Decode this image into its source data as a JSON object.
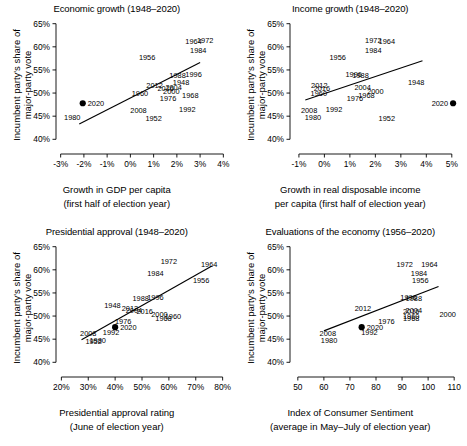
{
  "figure": {
    "ylabel": "Incumbent party's share of major-party vote",
    "ylabel_line1": "Incumbent party's share of",
    "ylabel_line2": "major-party vote",
    "y_ticks": [
      "40%",
      "45%",
      "50%",
      "55%",
      "60%",
      "65%"
    ],
    "y_tick_values": [
      40,
      45,
      50,
      55,
      60,
      65
    ],
    "highlight_year": "2020",
    "point_color": "#000000",
    "line_color": "#000000",
    "axis_color": "#000000",
    "background": "#ffffff"
  },
  "chart_data": [
    {
      "type": "scatter",
      "panel": "top-left",
      "title": "Economic growth (1948–2020)",
      "xlabel": "Growth in GDP per capita",
      "xlabel2": "(first half of election year)",
      "ylabel": "Incumbent party's share of major-party vote",
      "xlim": [
        -3.2,
        4.2
      ],
      "ylim": [
        39.2,
        65.8
      ],
      "x_ticks": [
        "-3%",
        "-2%",
        "-1%",
        "0%",
        "1%",
        "2%",
        "3%",
        "4%"
      ],
      "x_tick_values": [
        -3,
        -2,
        -1,
        0,
        1,
        2,
        3,
        4
      ],
      "y_ticks": [
        "40%",
        "45%",
        "50%",
        "55%",
        "60%",
        "65%"
      ],
      "y_tick_values": [
        40,
        45,
        50,
        55,
        60,
        65
      ],
      "grid": false,
      "legend": "none",
      "fit_line": {
        "x": [
          -2.2,
          3.0
        ],
        "y": [
          43.3,
          56.6
        ]
      },
      "labels": [
        "1948",
        "1952",
        "1956",
        "1960",
        "1964",
        "1968",
        "1972",
        "1976",
        "1980",
        "1984",
        "1988",
        "1992",
        "1996",
        "2000",
        "2004",
        "2008",
        "2012",
        "2016",
        "2020"
      ],
      "points": [
        {
          "year": "1948",
          "x": 2.18,
          "y": 52.4,
          "marker": false
        },
        {
          "year": "1952",
          "x": 1.0,
          "y": 44.6,
          "marker": false
        },
        {
          "year": "1956",
          "x": 0.72,
          "y": 57.8,
          "marker": false
        },
        {
          "year": "1960",
          "x": 0.41,
          "y": 49.9,
          "marker": false
        },
        {
          "year": "1964",
          "x": 2.72,
          "y": 61.3,
          "marker": false
        },
        {
          "year": "1968",
          "x": 2.58,
          "y": 49.6,
          "marker": false
        },
        {
          "year": "1972",
          "x": 3.22,
          "y": 61.4,
          "marker": false
        },
        {
          "year": "1976",
          "x": 1.62,
          "y": 48.9,
          "marker": false
        },
        {
          "year": "1980",
          "x": -2.5,
          "y": 44.7,
          "marker": false
        },
        {
          "year": "1984",
          "x": 2.92,
          "y": 59.2,
          "marker": false
        },
        {
          "year": "1988",
          "x": 2.03,
          "y": 53.9,
          "marker": false
        },
        {
          "year": "1992",
          "x": 2.45,
          "y": 46.5,
          "marker": false
        },
        {
          "year": "1996",
          "x": 2.72,
          "y": 54.0,
          "marker": false
        },
        {
          "year": "2000",
          "x": 1.76,
          "y": 50.3,
          "marker": false
        },
        {
          "year": "2004",
          "x": 1.86,
          "y": 51.2,
          "marker": false
        },
        {
          "year": "2008",
          "x": 0.35,
          "y": 46.3,
          "marker": false
        },
        {
          "year": "2012",
          "x": 1.04,
          "y": 51.8,
          "marker": false
        },
        {
          "year": "2016",
          "x": 1.52,
          "y": 51.1,
          "marker": false
        },
        {
          "year": "2020",
          "x": -2.05,
          "y": 47.8,
          "marker": true
        }
      ]
    },
    {
      "type": "scatter",
      "panel": "top-right",
      "title": "Income growth (1948–2020)",
      "xlabel": "Growth in real disposable income",
      "xlabel2": "per capita (first half of election year)",
      "ylabel": "Incumbent party's share of major-party vote",
      "xlim": [
        -1.35,
        5.4
      ],
      "ylim": [
        39.2,
        65.8
      ],
      "x_ticks": [
        "-1%",
        "0%",
        "1%",
        "2%",
        "3%",
        "4%",
        "5%"
      ],
      "x_tick_values": [
        -1,
        0,
        1,
        2,
        3,
        4,
        5
      ],
      "y_ticks": [
        "40%",
        "45%",
        "50%",
        "55%",
        "60%",
        "65%"
      ],
      "y_tick_values": [
        40,
        45,
        50,
        55,
        60,
        65
      ],
      "grid": false,
      "legend": "none",
      "fit_line": {
        "x": [
          -0.75,
          3.85
        ],
        "y": [
          48.5,
          57.0
        ]
      },
      "labels": [
        "1948",
        "1952",
        "1956",
        "1960",
        "1964",
        "1968",
        "1972",
        "1976",
        "1980",
        "1984",
        "1988",
        "1992",
        "1996",
        "2000",
        "2004",
        "2008",
        "2012",
        "2016",
        "2020"
      ],
      "points": [
        {
          "year": "1948",
          "x": 3.6,
          "y": 52.4,
          "marker": false
        },
        {
          "year": "1952",
          "x": 2.45,
          "y": 44.6,
          "marker": false
        },
        {
          "year": "1956",
          "x": 0.52,
          "y": 57.8,
          "marker": false
        },
        {
          "year": "1960",
          "x": -0.22,
          "y": 49.9,
          "marker": false
        },
        {
          "year": "1964",
          "x": 2.45,
          "y": 61.3,
          "marker": false
        },
        {
          "year": "1968",
          "x": 1.65,
          "y": 49.6,
          "marker": false
        },
        {
          "year": "1972",
          "x": 1.92,
          "y": 61.4,
          "marker": false
        },
        {
          "year": "1976",
          "x": 1.2,
          "y": 48.9,
          "marker": false
        },
        {
          "year": "1980",
          "x": -0.45,
          "y": 44.7,
          "marker": false
        },
        {
          "year": "1984",
          "x": 1.92,
          "y": 59.2,
          "marker": false
        },
        {
          "year": "1988",
          "x": 1.42,
          "y": 53.9,
          "marker": false
        },
        {
          "year": "1992",
          "x": 0.38,
          "y": 46.5,
          "marker": false
        },
        {
          "year": "1996",
          "x": 1.15,
          "y": 54.0,
          "marker": false
        },
        {
          "year": "2000",
          "x": 2.0,
          "y": 50.3,
          "marker": false
        },
        {
          "year": "2004",
          "x": 1.5,
          "y": 51.2,
          "marker": false
        },
        {
          "year": "2008",
          "x": -0.6,
          "y": 46.3,
          "marker": false
        },
        {
          "year": "2012",
          "x": -0.2,
          "y": 51.8,
          "marker": false
        },
        {
          "year": "2016",
          "x": -0.1,
          "y": 51.1,
          "marker": false
        },
        {
          "year": "2020",
          "x": 5.05,
          "y": 47.8,
          "marker": true
        }
      ]
    },
    {
      "type": "scatter",
      "panel": "bottom-left",
      "title": "Presidential approval (1948–2020)",
      "xlabel": "Presidential approval rating",
      "xlabel2": "(June of election year)",
      "ylabel": "Incumbent party's share of major-party vote",
      "xlim": [
        18,
        82
      ],
      "ylim": [
        39.2,
        65.8
      ],
      "x_ticks": [
        "20%",
        "30%",
        "40%",
        "50%",
        "60%",
        "70%",
        "80%"
      ],
      "x_tick_values": [
        20,
        30,
        40,
        50,
        60,
        70,
        80
      ],
      "y_ticks": [
        "40%",
        "45%",
        "50%",
        "55%",
        "60%",
        "65%"
      ],
      "y_tick_values": [
        40,
        45,
        50,
        55,
        60,
        65
      ],
      "grid": false,
      "legend": "none",
      "fit_line": {
        "x": [
          27.5,
          76.0
        ],
        "y": [
          44.9,
          60.8
        ]
      },
      "labels": [
        "1948",
        "1952",
        "1956",
        "1960",
        "1964",
        "1968",
        "1972",
        "1976",
        "1980",
        "1984",
        "1988",
        "1992",
        "1996",
        "2000",
        "2004",
        "2008",
        "2012",
        "2016",
        "2020"
      ],
      "points": [
        {
          "year": "1948",
          "x": 39.0,
          "y": 52.4,
          "marker": false
        },
        {
          "year": "1952",
          "x": 32.0,
          "y": 44.6,
          "marker": false
        },
        {
          "year": "1956",
          "x": 72.0,
          "y": 57.8,
          "marker": false
        },
        {
          "year": "1960",
          "x": 61.5,
          "y": 49.9,
          "marker": false
        },
        {
          "year": "1964",
          "x": 75.0,
          "y": 61.3,
          "marker": false
        },
        {
          "year": "1968",
          "x": 58.0,
          "y": 49.6,
          "marker": false
        },
        {
          "year": "1972",
          "x": 60.0,
          "y": 61.8,
          "marker": false
        },
        {
          "year": "1976",
          "x": 43.0,
          "y": 48.9,
          "marker": false
        },
        {
          "year": "1980",
          "x": 33.5,
          "y": 44.7,
          "marker": false
        },
        {
          "year": "1984",
          "x": 55.0,
          "y": 59.2,
          "marker": false
        },
        {
          "year": "1988",
          "x": 49.5,
          "y": 53.9,
          "marker": false
        },
        {
          "year": "1992",
          "x": 38.5,
          "y": 46.5,
          "marker": false
        },
        {
          "year": "1996",
          "x": 55.0,
          "y": 54.0,
          "marker": false
        },
        {
          "year": "2000",
          "x": 56.5,
          "y": 50.3,
          "marker": false
        },
        {
          "year": "2004",
          "x": 47.0,
          "y": 51.2,
          "marker": false
        },
        {
          "year": "2008",
          "x": 30.0,
          "y": 46.3,
          "marker": false
        },
        {
          "year": "2012",
          "x": 45.5,
          "y": 51.8,
          "marker": false
        },
        {
          "year": "2016",
          "x": 51.0,
          "y": 51.1,
          "marker": false
        },
        {
          "year": "2020",
          "x": 40.0,
          "y": 47.6,
          "marker": true
        }
      ]
    },
    {
      "type": "scatter",
      "panel": "bottom-right",
      "title": "Evaluations of the economy (1956–2020)",
      "xlabel": "Index of Consumer Sentiment",
      "xlabel2": "(average in May–July of election year)",
      "ylabel": "Incumbent party's share of major-party vote",
      "xlim": [
        47,
        113
      ],
      "ylim": [
        39.2,
        65.8
      ],
      "x_ticks": [
        "50",
        "60",
        "70",
        "80",
        "90",
        "100",
        "110"
      ],
      "x_tick_values": [
        50,
        60,
        70,
        80,
        90,
        100,
        110
      ],
      "y_ticks": [
        "40%",
        "45%",
        "50%",
        "55%",
        "60%",
        "65%"
      ],
      "y_tick_values": [
        40,
        45,
        50,
        55,
        60,
        65
      ],
      "grid": false,
      "legend": "none",
      "fit_line": {
        "x": [
          60.0,
          104.0
        ],
        "y": [
          46.8,
          56.4
        ]
      },
      "labels": [
        "1956",
        "1960",
        "1964",
        "1968",
        "1972",
        "1976",
        "1980",
        "1984",
        "1988",
        "1992",
        "1996",
        "2000",
        "2004",
        "2008",
        "2012",
        "2016",
        "2020"
      ],
      "points": [
        {
          "year": "1956",
          "x": 97.0,
          "y": 57.8,
          "marker": false
        },
        {
          "year": "1960",
          "x": 93.5,
          "y": 49.9,
          "marker": false
        },
        {
          "year": "1964",
          "x": 100.5,
          "y": 61.3,
          "marker": false
        },
        {
          "year": "1968",
          "x": 93.5,
          "y": 49.6,
          "marker": false
        },
        {
          "year": "1972",
          "x": 91.0,
          "y": 61.3,
          "marker": false
        },
        {
          "year": "1976",
          "x": 84.0,
          "y": 48.9,
          "marker": false
        },
        {
          "year": "1980",
          "x": 62.0,
          "y": 44.7,
          "marker": false
        },
        {
          "year": "1984",
          "x": 96.5,
          "y": 59.2,
          "marker": false
        },
        {
          "year": "1988",
          "x": 94.5,
          "y": 53.9,
          "marker": false
        },
        {
          "year": "1992",
          "x": 77.5,
          "y": 46.5,
          "marker": false
        },
        {
          "year": "1996",
          "x": 92.5,
          "y": 54.0,
          "marker": false
        },
        {
          "year": "2000",
          "x": 107.5,
          "y": 50.3,
          "marker": false
        },
        {
          "year": "2004",
          "x": 94.5,
          "y": 51.2,
          "marker": false
        },
        {
          "year": "2008",
          "x": 61.5,
          "y": 46.3,
          "marker": false
        },
        {
          "year": "2012",
          "x": 75.0,
          "y": 51.8,
          "marker": false
        },
        {
          "year": "2016",
          "x": 93.5,
          "y": 51.1,
          "marker": false
        },
        {
          "year": "2020",
          "x": 74.5,
          "y": 47.6,
          "marker": true
        }
      ]
    }
  ]
}
